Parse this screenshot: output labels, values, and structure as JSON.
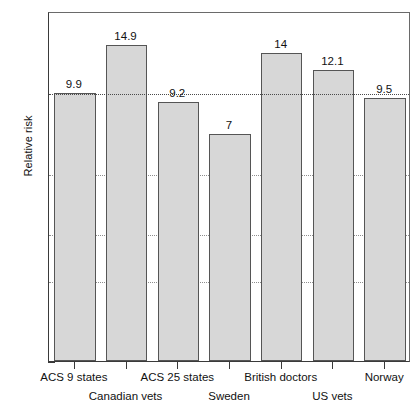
{
  "chart_data": {
    "type": "bar",
    "title": "",
    "subtitle": "",
    "xlabel": "",
    "ylabel": "Relative risk",
    "categories": [
      "ACS 9 states",
      "Canadian vets",
      "ACS 25 states",
      "Sweden",
      "British doctors",
      "US vets",
      "Norway"
    ],
    "values": [
      9.9,
      14.9,
      9.2,
      7,
      14,
      12.1,
      9.5
    ],
    "value_labels": [
      "9.9",
      "14.9",
      "9.2",
      "7",
      "14",
      "12.1",
      "9.5"
    ],
    "label_rows": [
      0,
      1,
      0,
      1,
      0,
      1,
      0
    ],
    "yscale": "log",
    "ylim": [
      1,
      20
    ],
    "yticks": [
      20,
      10,
      5,
      3,
      2,
      1
    ],
    "ytick_labels": [
      "20",
      "10",
      "5",
      "3",
      "2",
      "1"
    ],
    "yminor_ticks": [
      15,
      9,
      8,
      7,
      6,
      4
    ],
    "gridlines": [
      10,
      5,
      3,
      2
    ],
    "grid": true,
    "reference_line": 10,
    "legend": "none",
    "bar_color": "#d7d7d7",
    "bar_edge_color": "#555555",
    "axis_color": "#3a3a3a",
    "grid_color": "#8d8d8d",
    "text_color": "#111111"
  }
}
